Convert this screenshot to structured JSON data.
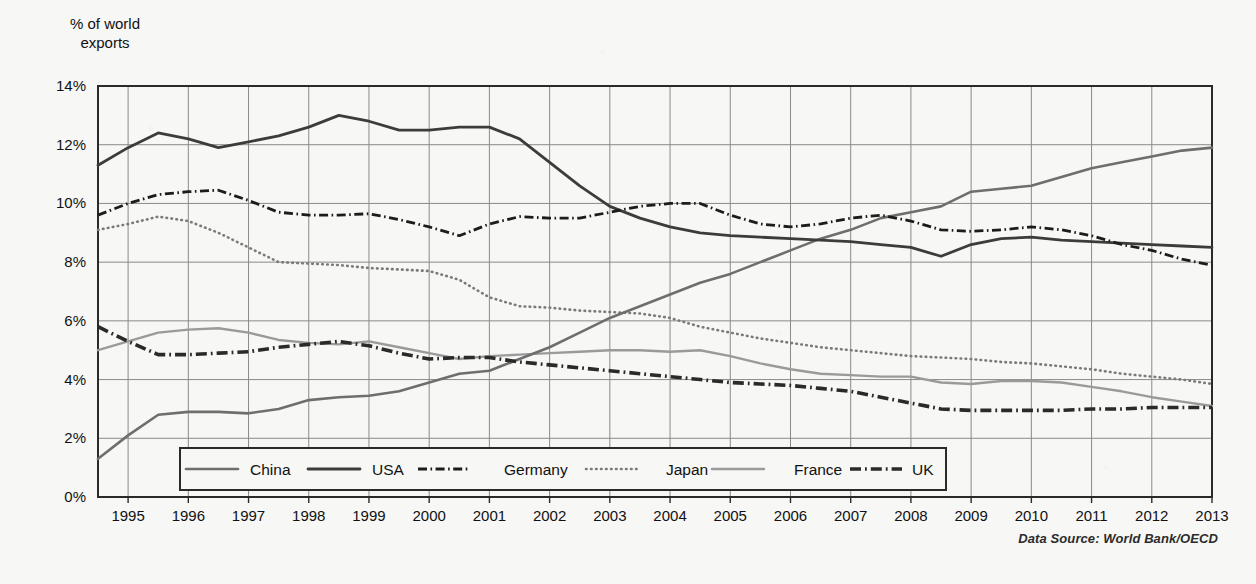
{
  "axis_title": "% of world\nexports",
  "source_note": "Data Source: World Bank/OECD",
  "legend": {
    "items": [
      {
        "label": "China",
        "style": "solid-medium",
        "color": "#6e6e6e"
      },
      {
        "label": "USA",
        "style": "solid-dark",
        "color": "#3c3c3c"
      },
      {
        "label": "Germany",
        "style": "dashdot-thin",
        "color": "#1c1c1c"
      },
      {
        "label": "Japan",
        "style": "dotted",
        "color": "#7a7a7a"
      },
      {
        "label": "France",
        "style": "solid-light",
        "color": "#9a9a9a"
      },
      {
        "label": "UK",
        "style": "dashdot-thick",
        "color": "#2a2a2a"
      }
    ]
  },
  "chart_data": {
    "type": "line",
    "title": "",
    "xlabel": "",
    "ylabel": "% of world exports",
    "xlim": [
      1994.5,
      2013
    ],
    "ylim": [
      0,
      14
    ],
    "yticks": [
      "0%",
      "2%",
      "4%",
      "6%",
      "8%",
      "10%",
      "12%",
      "14%"
    ],
    "ytick_values": [
      0,
      2,
      4,
      6,
      8,
      10,
      12,
      14
    ],
    "grid": true,
    "legend_position": "bottom-inside",
    "x": [
      1994.5,
      1995,
      1995.5,
      1996,
      1996.5,
      1997,
      1997.5,
      1998,
      1998.5,
      1999,
      1999.5,
      2000,
      2000.5,
      2001,
      2001.5,
      2002,
      2002.5,
      2003,
      2003.5,
      2004,
      2004.5,
      2005,
      2005.5,
      2006,
      2006.5,
      2007,
      2007.5,
      2008,
      2008.5,
      2009,
      2009.5,
      2010,
      2010.5,
      2011,
      2011.5,
      2012,
      2012.5,
      2013
    ],
    "xticks": [
      "1995",
      "1996",
      "1997",
      "1998",
      "1999",
      "2000",
      "2001",
      "2002",
      "2003",
      "2004",
      "2005",
      "2006",
      "2007",
      "2008",
      "2009",
      "2010",
      "2011",
      "2012",
      "2013"
    ],
    "xtick_values": [
      1995,
      1996,
      1997,
      1998,
      1999,
      2000,
      2001,
      2002,
      2003,
      2004,
      2005,
      2006,
      2007,
      2008,
      2009,
      2010,
      2011,
      2012,
      2013
    ],
    "series": [
      {
        "name": "China",
        "color": "#6e6e6e",
        "style": "solid-medium",
        "values": [
          1.3,
          2.1,
          2.8,
          2.9,
          2.9,
          2.85,
          3.0,
          3.3,
          3.4,
          3.45,
          3.6,
          3.9,
          4.2,
          4.3,
          4.7,
          5.1,
          5.6,
          6.1,
          6.5,
          6.9,
          7.3,
          7.6,
          8.0,
          8.4,
          8.8,
          9.1,
          9.5,
          9.7,
          9.9,
          10.4,
          10.5,
          10.6,
          10.9,
          11.2,
          11.4,
          11.6,
          11.8,
          11.9
        ]
      },
      {
        "name": "USA",
        "color": "#3c3c3c",
        "style": "solid-dark",
        "values": [
          11.3,
          11.9,
          12.4,
          12.2,
          11.9,
          12.1,
          12.3,
          12.6,
          13.0,
          12.8,
          12.5,
          12.5,
          12.6,
          12.6,
          12.2,
          11.4,
          10.6,
          9.9,
          9.5,
          9.2,
          9.0,
          8.9,
          8.85,
          8.8,
          8.75,
          8.7,
          8.6,
          8.5,
          8.2,
          8.6,
          8.8,
          8.85,
          8.75,
          8.7,
          8.65,
          8.6,
          8.55,
          8.5
        ]
      },
      {
        "name": "Germany",
        "color": "#1c1c1c",
        "style": "dashdot-thin",
        "values": [
          9.6,
          10.0,
          10.3,
          10.4,
          10.45,
          10.1,
          9.7,
          9.6,
          9.6,
          9.65,
          9.45,
          9.2,
          8.9,
          9.3,
          9.55,
          9.5,
          9.5,
          9.7,
          9.9,
          10.0,
          10.0,
          9.6,
          9.3,
          9.2,
          9.3,
          9.5,
          9.6,
          9.4,
          9.1,
          9.05,
          9.1,
          9.2,
          9.1,
          8.9,
          8.6,
          8.4,
          8.1,
          7.9
        ]
      },
      {
        "name": "Japan",
        "color": "#7a7a7a",
        "style": "dotted",
        "values": [
          9.1,
          9.3,
          9.55,
          9.4,
          9.0,
          8.5,
          8.0,
          7.95,
          7.9,
          7.8,
          7.75,
          7.7,
          7.4,
          6.8,
          6.5,
          6.45,
          6.35,
          6.3,
          6.25,
          6.1,
          5.8,
          5.6,
          5.4,
          5.25,
          5.1,
          5.0,
          4.9,
          4.8,
          4.75,
          4.7,
          4.6,
          4.55,
          4.45,
          4.35,
          4.2,
          4.1,
          4.0,
          3.85
        ]
      },
      {
        "name": "France",
        "color": "#9a9a9a",
        "style": "solid-light",
        "values": [
          5.0,
          5.3,
          5.6,
          5.7,
          5.75,
          5.6,
          5.35,
          5.25,
          5.2,
          5.3,
          5.1,
          4.9,
          4.7,
          4.8,
          4.85,
          4.9,
          4.95,
          5.0,
          5.0,
          4.95,
          5.0,
          4.8,
          4.55,
          4.35,
          4.2,
          4.15,
          4.1,
          4.1,
          3.9,
          3.85,
          3.95,
          3.95,
          3.9,
          3.75,
          3.6,
          3.4,
          3.25,
          3.1
        ]
      },
      {
        "name": "UK",
        "color": "#2a2a2a",
        "style": "dashdot-thick",
        "values": [
          5.8,
          5.3,
          4.85,
          4.85,
          4.9,
          4.95,
          5.1,
          5.2,
          5.3,
          5.15,
          4.9,
          4.7,
          4.75,
          4.75,
          4.6,
          4.5,
          4.4,
          4.3,
          4.2,
          4.1,
          4.0,
          3.9,
          3.85,
          3.8,
          3.7,
          3.6,
          3.4,
          3.2,
          3.0,
          2.95,
          2.95,
          2.95,
          2.95,
          3.0,
          3.0,
          3.05,
          3.05,
          3.05
        ]
      }
    ]
  }
}
